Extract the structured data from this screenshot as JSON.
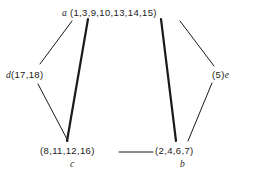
{
  "diagram": {
    "type": "undirected-graph",
    "background_color": "#ffffff",
    "line_color": "#1a1a1a",
    "nodes": [
      {
        "id": "a",
        "name": "a",
        "set": "(1,3,9,10,13,14,15)",
        "label_order": "name-then-set",
        "position": "top-center",
        "x": 128,
        "y": 13
      },
      {
        "id": "d",
        "name": "d",
        "set": "(17,18)",
        "label_order": "name-then-set",
        "position": "middle-left",
        "x": 38,
        "y": 75
      },
      {
        "id": "e",
        "name": "e",
        "set": "(5)",
        "label_order": "set-then-name",
        "position": "middle-right",
        "x": 222,
        "y": 75
      },
      {
        "id": "c",
        "name": "c",
        "set": "(8,11,12,16)",
        "label_order": "set-above-name",
        "position": "bottom-left",
        "x": 78,
        "y": 151
      },
      {
        "id": "b",
        "name": "b",
        "set": "(2,4,6,7)",
        "label_order": "set-above-name",
        "position": "bottom-right",
        "x": 188,
        "y": 151
      }
    ],
    "edges": [
      {
        "from": "a",
        "to": "d",
        "weight": "thin",
        "width": 1,
        "x1": 72,
        "y1": 21,
        "x2": 40,
        "y2": 64
      },
      {
        "from": "a",
        "to": "c",
        "weight": "thick",
        "width": 2.2,
        "x1": 88,
        "y1": 19,
        "x2": 67,
        "y2": 141
      },
      {
        "from": "a",
        "to": "b",
        "weight": "thick",
        "width": 2.2,
        "x1": 161,
        "y1": 19,
        "x2": 176,
        "y2": 141
      },
      {
        "from": "a",
        "to": "e",
        "weight": "thin",
        "width": 1,
        "x1": 180,
        "y1": 21,
        "x2": 214,
        "y2": 66
      },
      {
        "from": "d",
        "to": "c",
        "weight": "thin",
        "width": 1,
        "x1": 38,
        "y1": 84,
        "x2": 68,
        "y2": 141
      },
      {
        "from": "e",
        "to": "b",
        "weight": "thin",
        "width": 1,
        "x1": 212,
        "y1": 83,
        "x2": 188,
        "y2": 141
      },
      {
        "from": "c",
        "to": "b",
        "weight": "thin",
        "width": 1,
        "x1": 119,
        "y1": 152,
        "x2": 153,
        "y2": 152
      }
    ]
  }
}
